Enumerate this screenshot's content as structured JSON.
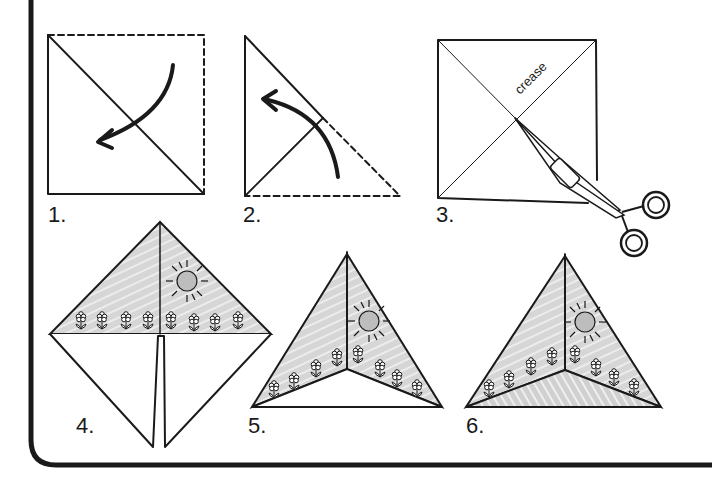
{
  "diagram": {
    "colors": {
      "ink": "#1a1a1a",
      "shade": "#d2d2d2",
      "sun": "#b8b8b8",
      "background": "#ffffff"
    },
    "steps": [
      {
        "number": "1.",
        "description": "Square with dashed top/right edge, diagonal fold, curved arrow fold down-left"
      },
      {
        "number": "2.",
        "description": "Triangle, dashed half folding up-left with curved arrow"
      },
      {
        "number": "3.",
        "description": "Square with two diagonal creases, scissors cutting along one crease to center",
        "annotation": "crease"
      },
      {
        "number": "4.",
        "description": "Diamond with illustrated upper half (sun and flowers), slit cut in lower half"
      },
      {
        "number": "5.",
        "description": "Folded pyramid shape showing illustrated sides"
      },
      {
        "number": "6.",
        "description": "Finished pyramid with shaded base"
      }
    ]
  }
}
